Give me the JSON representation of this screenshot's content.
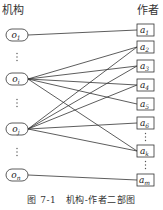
{
  "headings": {
    "left": "机构",
    "right": "作者"
  },
  "caption": "图 7-1　机构-作者二部图",
  "institutions": [
    {
      "id": "o1",
      "base": "o",
      "sub": "1",
      "y": 35
    },
    {
      "id": "oi",
      "base": "o",
      "sub": "i",
      "y": 79
    },
    {
      "id": "oj",
      "base": "o",
      "sub": "j",
      "y": 129
    },
    {
      "id": "on",
      "base": "o",
      "sub": "n",
      "y": 175
    }
  ],
  "authors": [
    {
      "id": "a1",
      "base": "a",
      "sub": "1",
      "y": 30
    },
    {
      "id": "a2",
      "base": "a",
      "sub": "2",
      "y": 47
    },
    {
      "id": "a3",
      "base": "a",
      "sub": "3",
      "y": 66
    },
    {
      "id": "a4",
      "base": "a",
      "sub": "4",
      "y": 85
    },
    {
      "id": "a5",
      "base": "a",
      "sub": "5",
      "y": 104
    },
    {
      "id": "a6",
      "base": "a",
      "sub": "6",
      "y": 123
    },
    {
      "id": "ak",
      "base": "a",
      "sub": "k",
      "y": 151
    },
    {
      "id": "am",
      "base": "a",
      "sub": "m",
      "y": 180
    }
  ],
  "edges": [
    [
      "o1",
      "a1"
    ],
    [
      "oi",
      "a2"
    ],
    [
      "oi",
      "a3"
    ],
    [
      "oi",
      "a4"
    ],
    [
      "oi",
      "a5"
    ],
    [
      "oi",
      "ak"
    ],
    [
      "oj",
      "a2"
    ],
    [
      "oj",
      "a3"
    ],
    [
      "oj",
      "a4"
    ],
    [
      "oj",
      "a6"
    ],
    [
      "oj",
      "ak"
    ],
    [
      "on",
      "am"
    ]
  ],
  "ellipsis_left": [
    57,
    103,
    152
  ],
  "ellipsis_right": [
    137,
    165
  ]
}
